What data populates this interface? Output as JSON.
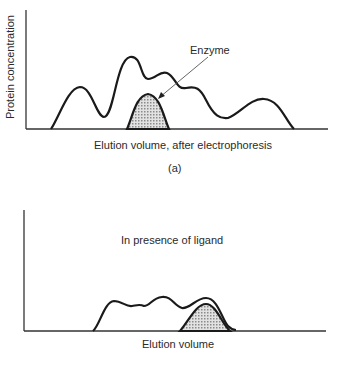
{
  "panel_a": {
    "y_axis_label": "Protein concentration",
    "x_axis_label": "Elution volume, after electrophoresis",
    "annotation": "Enzyme",
    "caption": "(a)"
  },
  "panel_b": {
    "x_axis_label": "Elution volume",
    "annotation": "In presence of ligand"
  },
  "colors": {
    "line": "#1a1a1a",
    "shaded_peak": "#bdbdbd",
    "background": "#ffffff"
  }
}
